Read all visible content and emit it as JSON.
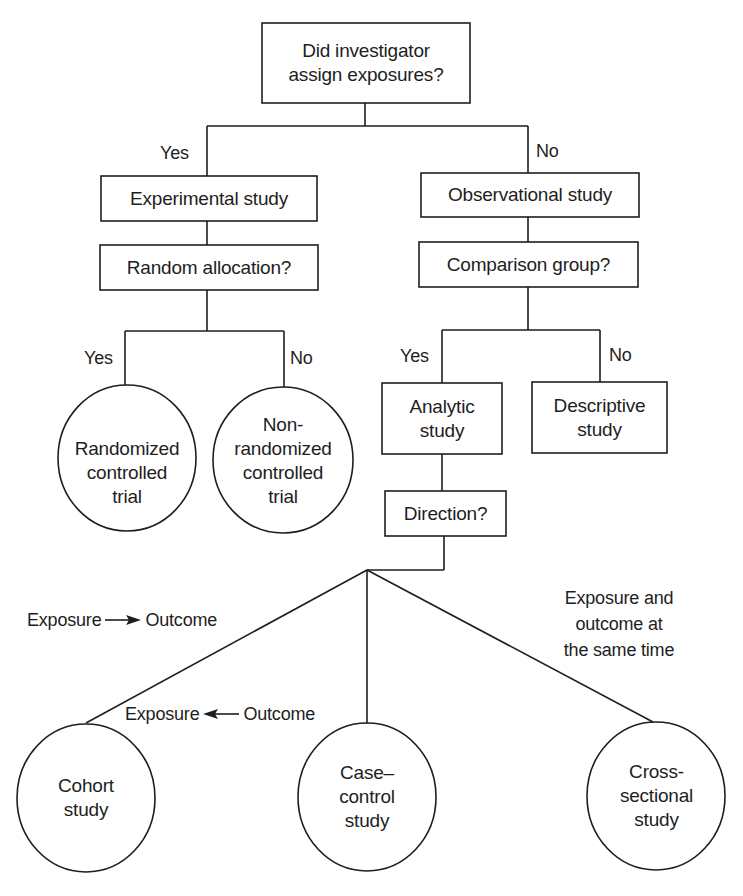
{
  "diagram": {
    "root": {
      "text": "Did investigator\nassign exposures?"
    },
    "root_branches": {
      "yes": "Yes",
      "no": "No"
    },
    "experimental": {
      "text": "Experimental study"
    },
    "random_allocation": {
      "text": "Random allocation?"
    },
    "random_branches": {
      "yes": "Yes",
      "no": "No"
    },
    "rct": {
      "text": "Randomized\ncontrolled\ntrial"
    },
    "nrct": {
      "text": "Non-\nrandomized\ncontrolled\ntrial"
    },
    "observational": {
      "text": "Observational study"
    },
    "comparison_group": {
      "text": "Comparison group?"
    },
    "comparison_branches": {
      "yes": "Yes",
      "no": "No"
    },
    "analytic": {
      "text": "Analytic\nstudy"
    },
    "descriptive": {
      "text": "Descriptive\nstudy"
    },
    "direction": {
      "text": "Direction?"
    },
    "direction_labels": {
      "forward": {
        "from": "Exposure",
        "arrow": "right-arrow",
        "to": "Outcome"
      },
      "backward": {
        "from": "Exposure",
        "arrow": "left-arrow",
        "to": "Outcome"
      },
      "same_time": "Exposure and\noutcome at\nthe same time"
    },
    "cohort": {
      "text": "Cohort\nstudy"
    },
    "case_control": {
      "text": "Case–\ncontrol\nstudy"
    },
    "cross_sectional": {
      "text": "Cross-\nsectional\nstudy"
    }
  },
  "colors": {
    "line": "#1e1e1e",
    "background": "#ffffff",
    "text": "#1e1e1e"
  }
}
